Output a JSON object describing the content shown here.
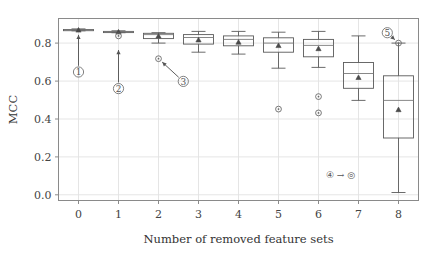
{
  "chart_data": {
    "type": "box",
    "title": "",
    "xlabel": "Number of removed feature sets",
    "ylabel": "MCC",
    "categories": [
      "0",
      "1",
      "2",
      "3",
      "4",
      "5",
      "6",
      "7",
      "8"
    ],
    "ylim": [
      -0.03,
      0.93
    ],
    "yticks": [
      0.0,
      0.2,
      0.4,
      0.6,
      0.8
    ],
    "ytick_labels": [
      "0.0",
      "0.2",
      "0.4",
      "0.6",
      "0.8"
    ],
    "xtick_labels": [
      "0",
      "1",
      "2",
      "3",
      "4",
      "5",
      "6",
      "7",
      "8"
    ],
    "grid": true,
    "legend_position": "none",
    "boxes": [
      {
        "category": "0",
        "whisker_low": 0.865,
        "q1": 0.868,
        "median": 0.87,
        "q3": 0.872,
        "whisker_high": 0.875,
        "mean": 0.87,
        "outliers": []
      },
      {
        "category": "1",
        "whisker_low": 0.855,
        "q1": 0.858,
        "median": 0.86,
        "q3": 0.862,
        "whisker_high": 0.865,
        "mean": 0.86,
        "outliers": [
          0.838
        ]
      },
      {
        "category": "2",
        "whisker_low": 0.8,
        "q1": 0.824,
        "median": 0.845,
        "q3": 0.852,
        "whisker_high": 0.855,
        "mean": 0.838,
        "outliers": [
          0.718
        ]
      },
      {
        "category": "3",
        "whisker_low": 0.752,
        "q1": 0.795,
        "median": 0.83,
        "q3": 0.845,
        "whisker_high": 0.862,
        "mean": 0.818,
        "outliers": []
      },
      {
        "category": "4",
        "whisker_low": 0.742,
        "q1": 0.786,
        "median": 0.82,
        "q3": 0.838,
        "whisker_high": 0.862,
        "mean": 0.806,
        "outliers": []
      },
      {
        "category": "5",
        "whisker_low": 0.668,
        "q1": 0.752,
        "median": 0.8,
        "q3": 0.828,
        "whisker_high": 0.858,
        "mean": 0.788,
        "outliers": [
          0.452
        ]
      },
      {
        "category": "6",
        "whisker_low": 0.672,
        "q1": 0.728,
        "median": 0.788,
        "q3": 0.82,
        "whisker_high": 0.862,
        "mean": 0.772,
        "outliers": [
          0.518,
          0.432
        ]
      },
      {
        "category": "7",
        "whisker_low": 0.498,
        "q1": 0.562,
        "median": 0.64,
        "q3": 0.698,
        "whisker_high": 0.838,
        "mean": 0.62,
        "outliers": []
      },
      {
        "category": "8",
        "whisker_low": 0.012,
        "q1": 0.3,
        "median": 0.498,
        "q3": 0.628,
        "whisker_high": 0.8,
        "mean": 0.45,
        "outliers": [
          0.8
        ]
      }
    ],
    "annotations": [
      {
        "id": "1",
        "label": "①",
        "type": "arrow-callout",
        "target_category": "0",
        "target_value": 0.87,
        "text_x": 0.0,
        "text_y": 0.648
      },
      {
        "id": "2",
        "label": "②",
        "type": "arrow-callout",
        "target_category": "1",
        "target_value": 0.79,
        "text_x": 1.0,
        "text_y": 0.56
      },
      {
        "id": "3",
        "label": "③",
        "type": "arrow-callout",
        "target_category": "2",
        "target_value": 0.718,
        "text_x": 2.62,
        "text_y": 0.598
      },
      {
        "id": "4",
        "label": "④",
        "type": "legend-inline",
        "text": "④ → ◎",
        "text_x": 6.55,
        "text_y": 0.106
      },
      {
        "id": "5",
        "label": "⑤",
        "type": "arrow-callout",
        "target_category": "8",
        "target_value": 0.8,
        "text_x": 7.72,
        "text_y": 0.855
      }
    ],
    "markers": {
      "mean_marker": "triangle",
      "outlier_marker": "circle-dot",
      "median_line": "horizontal-line"
    },
    "colors": {
      "box_edge": "#5a5a5a",
      "median": "#7a7a7a",
      "whisker": "#5a5a5a",
      "mean": "#4a4a4a",
      "outlier": "#6a6a6a",
      "grid": "#e2e2e2",
      "frame": "#8a8a8a",
      "background": "#ffffff",
      "text": "#3a3a3a"
    }
  }
}
